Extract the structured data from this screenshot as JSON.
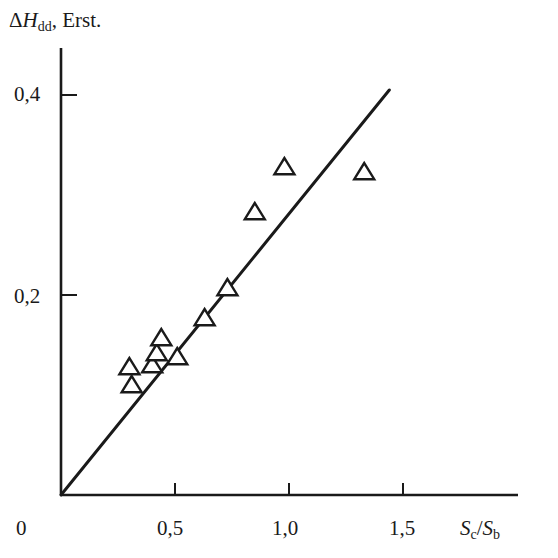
{
  "chart_data": {
    "type": "scatter",
    "title": "",
    "ylabel": "ΔH_dd, Erst.",
    "xlabel": "S_c/S_b",
    "xlim": [
      0,
      1.9
    ],
    "ylim": [
      0,
      0.44
    ],
    "x_ticks": [
      0.5,
      1.0,
      1.5
    ],
    "x_tick_labels": [
      "0,5",
      "1,0",
      "1,5"
    ],
    "y_ticks": [
      0.2,
      0.4
    ],
    "y_tick_labels": [
      "0,2",
      "0,4"
    ],
    "origin_label": "0",
    "grid": false,
    "legend": null,
    "series": [
      {
        "name": "measured",
        "marker": "open-triangle",
        "points": [
          {
            "x": 0.3,
            "y": 0.128
          },
          {
            "x": 0.31,
            "y": 0.11
          },
          {
            "x": 0.4,
            "y": 0.13
          },
          {
            "x": 0.42,
            "y": 0.142
          },
          {
            "x": 0.44,
            "y": 0.157
          },
          {
            "x": 0.51,
            "y": 0.138
          },
          {
            "x": 0.63,
            "y": 0.177
          },
          {
            "x": 0.73,
            "y": 0.207
          },
          {
            "x": 0.85,
            "y": 0.283
          },
          {
            "x": 0.98,
            "y": 0.328
          },
          {
            "x": 1.33,
            "y": 0.323
          }
        ]
      },
      {
        "name": "fit line",
        "type": "line",
        "points": [
          {
            "x": 0.0,
            "y": 0.0
          },
          {
            "x": 1.44,
            "y": 0.405
          }
        ]
      }
    ]
  },
  "labels": {
    "y_delta": "Δ",
    "y_H": "H",
    "y_sub": "dd",
    "y_unit": ", Erst.",
    "x_S1": "S",
    "x_sub1": "c",
    "x_slash": "/",
    "x_S2": "S",
    "x_sub2": "b",
    "origin": "0",
    "xt0": "0,5",
    "xt1": "1,0",
    "xt2": "1,5",
    "yt0": "0,2",
    "yt1": "0,4"
  }
}
